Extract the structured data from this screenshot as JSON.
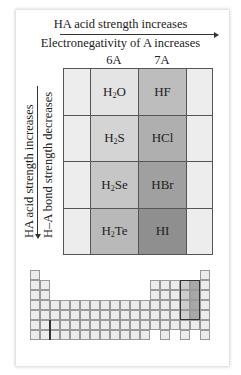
{
  "diagram": {
    "top_arrow_label": "HA acid strength increases",
    "top_sub_label": "Electronegativity of A increases",
    "column_headers": [
      "6A",
      "7A"
    ],
    "left_arrow_label": "HA acid strength increases",
    "left_sub_label": "H–A bond strength decreases",
    "rows": [
      {
        "col6A": {
          "base": "H",
          "sub": "2",
          "rest": "O"
        },
        "col7A": "HF"
      },
      {
        "col6A": {
          "base": "H",
          "sub": "2",
          "rest": "S"
        },
        "col7A": "HCl"
      },
      {
        "col6A": {
          "base": "H",
          "sub": "2",
          "rest": "Se"
        },
        "col7A": "HBr"
      },
      {
        "col6A": {
          "base": "H",
          "sub": "2",
          "rest": "Te"
        },
        "col7A": "HI"
      }
    ],
    "colors": {
      "side": "#ededed",
      "col6A": [
        "#e4e4e4",
        "#d4d4d4",
        "#c6c6c6",
        "#b9b9b9"
      ],
      "col7A": [
        "#bdbdbd",
        "#afafaf",
        "#a0a0a0",
        "#8f8f8f"
      ]
    },
    "periodic_table_inset": {
      "description": "Mini periodic table with groups 6A and 7A, periods 2-5 highlighted",
      "highlighted_groups": [
        "6A",
        "7A"
      ],
      "highlighted_periods": [
        2,
        3,
        4,
        5
      ]
    }
  }
}
